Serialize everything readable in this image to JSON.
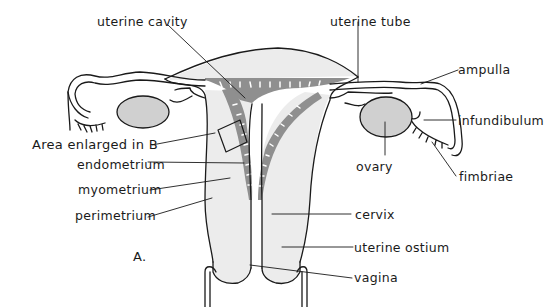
{
  "figure": {
    "panel_label": "A.",
    "colors": {
      "outline": "#1a1a1a",
      "tissue_fill": "#ececec",
      "endometrium_fill": "#8f8f8f",
      "ovary_fill": "#d0d0d0",
      "background": "#ffffff"
    },
    "labels": {
      "uterine_cavity": "uterine cavity",
      "uterine_tube": "uterine tube",
      "ampulla": "ampulla",
      "infundibulum": "infundibulum",
      "fimbriae": "fimbriae",
      "ovary": "ovary",
      "area_enlarged": "Area enlarged in B",
      "endometrium": "endometrium",
      "myometrium": "myometrium",
      "perimetrium": "perimetrium",
      "cervix": "cervix",
      "uterine_ostium": "uterine ostium",
      "vagina": "vagina"
    }
  }
}
